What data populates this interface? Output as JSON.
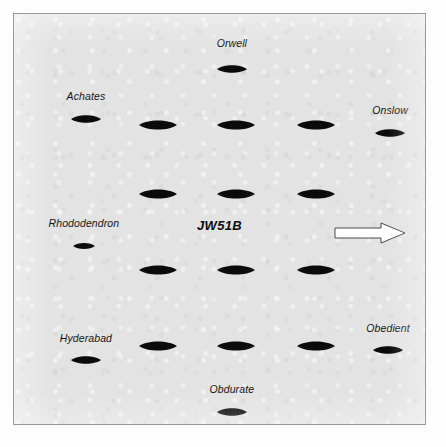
{
  "diagram": {
    "title": "JW51B",
    "title_position": {
      "x": 50.0,
      "y": 51.5
    },
    "background_color": "#e3e3e3",
    "border_color": "#9a9a9a",
    "symbol_color": "#0b0b0b",
    "arrow": {
      "name": "direction-of-travel-arrow",
      "direction": "right",
      "fill_color": "#ffffff",
      "outline_color": "#4a4a4a",
      "position": {
        "x": 86.5,
        "y": 53.5
      },
      "width": 72,
      "height": 22
    }
  },
  "labeled_ships": [
    {
      "name": "Orwell",
      "label_pos": {
        "x": 53.0,
        "y": 7.0
      },
      "symbol_pos": {
        "x": 53.0,
        "y": 13.5
      },
      "symbol_w": 30,
      "symbol_h": 10
    },
    {
      "name": "Achates",
      "label_pos": {
        "x": 17.5,
        "y": 20.0
      },
      "symbol_pos": {
        "x": 17.5,
        "y": 25.5
      },
      "symbol_w": 30,
      "symbol_h": 10
    },
    {
      "name": "Onslow",
      "label_pos": {
        "x": 91.5,
        "y": 23.5
      },
      "symbol_pos": {
        "x": 91.5,
        "y": 29.0
      },
      "symbol_w": 30,
      "symbol_h": 10
    },
    {
      "name": "Rhododendron",
      "label_pos": {
        "x": 17.0,
        "y": 51.0
      },
      "symbol_pos": {
        "x": 17.0,
        "y": 56.5
      },
      "symbol_w": 22,
      "symbol_h": 8
    },
    {
      "name": "Hyderabad",
      "label_pos": {
        "x": 17.5,
        "y": 79.0
      },
      "symbol_pos": {
        "x": 17.5,
        "y": 84.5
      },
      "symbol_w": 30,
      "symbol_h": 10
    },
    {
      "name": "Obedient",
      "label_pos": {
        "x": 91.0,
        "y": 76.5
      },
      "symbol_pos": {
        "x": 91.0,
        "y": 82.0
      },
      "symbol_w": 30,
      "symbol_h": 10
    },
    {
      "name": "Obdurate",
      "label_pos": {
        "x": 53.0,
        "y": 91.5
      },
      "symbol_pos": {
        "x": 53.0,
        "y": 97.0
      },
      "symbol_w": 30,
      "symbol_h": 10
    }
  ],
  "merchant_ships": [
    {
      "row": 1,
      "col": 1,
      "pos": {
        "x": 35.0,
        "y": 27.0
      },
      "symbol_w": 38,
      "symbol_h": 12
    },
    {
      "row": 1,
      "col": 2,
      "pos": {
        "x": 54.0,
        "y": 27.0
      },
      "symbol_w": 38,
      "symbol_h": 12
    },
    {
      "row": 1,
      "col": 3,
      "pos": {
        "x": 73.5,
        "y": 27.0
      },
      "symbol_w": 38,
      "symbol_h": 12
    },
    {
      "row": 2,
      "col": 1,
      "pos": {
        "x": 35.0,
        "y": 44.0
      },
      "symbol_w": 38,
      "symbol_h": 12
    },
    {
      "row": 2,
      "col": 2,
      "pos": {
        "x": 54.0,
        "y": 44.0
      },
      "symbol_w": 38,
      "symbol_h": 12
    },
    {
      "row": 2,
      "col": 3,
      "pos": {
        "x": 73.5,
        "y": 44.0
      },
      "symbol_w": 38,
      "symbol_h": 12
    },
    {
      "row": 3,
      "col": 1,
      "pos": {
        "x": 35.0,
        "y": 62.5
      },
      "symbol_w": 38,
      "symbol_h": 12
    },
    {
      "row": 3,
      "col": 2,
      "pos": {
        "x": 54.0,
        "y": 62.5
      },
      "symbol_w": 38,
      "symbol_h": 12
    },
    {
      "row": 3,
      "col": 3,
      "pos": {
        "x": 73.5,
        "y": 62.5
      },
      "symbol_w": 38,
      "symbol_h": 12
    },
    {
      "row": 4,
      "col": 1,
      "pos": {
        "x": 35.0,
        "y": 81.0
      },
      "symbol_w": 38,
      "symbol_h": 12
    },
    {
      "row": 4,
      "col": 2,
      "pos": {
        "x": 54.0,
        "y": 81.0
      },
      "symbol_w": 38,
      "symbol_h": 12
    },
    {
      "row": 4,
      "col": 3,
      "pos": {
        "x": 73.5,
        "y": 81.0
      },
      "symbol_w": 38,
      "symbol_h": 12
    }
  ]
}
